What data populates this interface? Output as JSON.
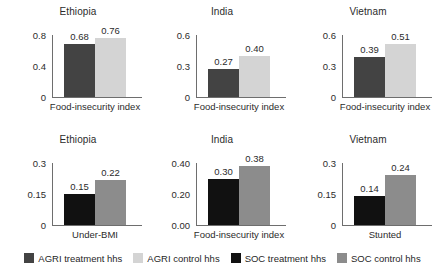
{
  "chart_data": {
    "type": "bar",
    "title": "",
    "layout": {
      "rows": 2,
      "cols": 3,
      "grid": false,
      "legend_position": "bottom"
    },
    "legend": [
      {
        "label": "AGRI treatment hhs",
        "color": "#434343"
      },
      {
        "label": "AGRI control hhs",
        "color": "#d4d4d4"
      },
      {
        "label": "SOC treatment hhs",
        "color": "#111111"
      },
      {
        "label": "SOC control hhs",
        "color": "#8c8c8c"
      }
    ],
    "panels": [
      {
        "title": "Ethiopia",
        "xlabel": "Food-insecurity index",
        "ylim": [
          0,
          0.8
        ],
        "ticks": [
          "0",
          "0.4",
          "0.8"
        ],
        "tickvals": [
          0,
          0.4,
          0.8
        ],
        "categories": [
          "AGRI treatment hhs",
          "AGRI control hhs"
        ],
        "values": [
          0.68,
          0.76
        ],
        "labels": [
          "0.68",
          "0.76"
        ],
        "colors": [
          "#434343",
          "#d4d4d4"
        ]
      },
      {
        "title": "India",
        "xlabel": "Food-insecurity index",
        "ylim": [
          0,
          0.6
        ],
        "ticks": [
          "0",
          "0.3",
          "0.6"
        ],
        "tickvals": [
          0,
          0.3,
          0.6
        ],
        "categories": [
          "AGRI treatment hhs",
          "AGRI control hhs"
        ],
        "values": [
          0.27,
          0.4
        ],
        "labels": [
          "0.27",
          "0.40"
        ],
        "colors": [
          "#434343",
          "#d4d4d4"
        ]
      },
      {
        "title": "Vietnam",
        "xlabel": "Food-insecurity index",
        "ylim": [
          0,
          0.6
        ],
        "ticks": [
          "0",
          "0.3",
          "0.6"
        ],
        "tickvals": [
          0,
          0.3,
          0.6
        ],
        "categories": [
          "AGRI treatment hhs",
          "AGRI control hhs"
        ],
        "values": [
          0.39,
          0.51
        ],
        "labels": [
          "0.39",
          "0.51"
        ],
        "colors": [
          "#434343",
          "#d4d4d4"
        ]
      },
      {
        "title": "Ethiopia",
        "xlabel": "Under-BMI",
        "ylim": [
          0,
          0.3
        ],
        "ticks": [
          "0",
          "0.15",
          "0.3"
        ],
        "tickvals": [
          0,
          0.15,
          0.3
        ],
        "categories": [
          "SOC treatment hhs",
          "SOC control hhs"
        ],
        "values": [
          0.15,
          0.22
        ],
        "labels": [
          "0.15",
          "0.22"
        ],
        "colors": [
          "#111111",
          "#8c8c8c"
        ]
      },
      {
        "title": "India",
        "xlabel": "Food-insecurity index",
        "ylim": [
          0,
          0.4
        ],
        "ticks": [
          "0.00",
          "0.20",
          "0.40"
        ],
        "tickvals": [
          0,
          0.2,
          0.4
        ],
        "categories": [
          "SOC treatment hhs",
          "SOC control hhs"
        ],
        "values": [
          0.3,
          0.38
        ],
        "labels": [
          "0.30",
          "0.38"
        ],
        "colors": [
          "#111111",
          "#8c8c8c"
        ]
      },
      {
        "title": "Vietnam",
        "xlabel": "Stunted",
        "ylim": [
          0,
          0.3
        ],
        "ticks": [
          "0",
          "0.15",
          "0.3"
        ],
        "tickvals": [
          0,
          0.15,
          0.3
        ],
        "categories": [
          "SOC treatment hhs",
          "SOC control hhs"
        ],
        "values": [
          0.14,
          0.24
        ],
        "labels": [
          "0.14",
          "0.24"
        ],
        "colors": [
          "#111111",
          "#8c8c8c"
        ]
      }
    ]
  }
}
